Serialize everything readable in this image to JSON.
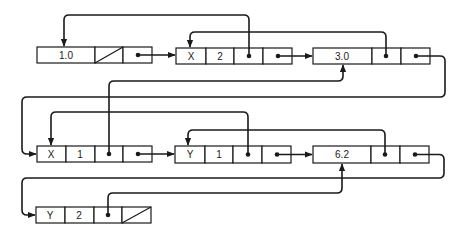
{
  "diagram": {
    "type": "linked-list-structure",
    "colors": {
      "ink": "#1a1a1a",
      "background": "#ffffff"
    },
    "nodes": [
      {
        "id": "n1",
        "fields": [
          "1.0",
          "null",
          "ptr"
        ],
        "label": "1.0"
      },
      {
        "id": "n2",
        "fields": [
          "X",
          "2",
          "ptr",
          "ptr"
        ],
        "var": "X",
        "exp": "2"
      },
      {
        "id": "n3",
        "fields": [
          "3.0",
          "ptr",
          "ptr"
        ],
        "label": "3.0"
      },
      {
        "id": "n4",
        "fields": [
          "X",
          "1",
          "ptr",
          "ptr"
        ],
        "var": "X",
        "exp": "1"
      },
      {
        "id": "n5",
        "fields": [
          "Y",
          "1",
          "ptr",
          "ptr"
        ],
        "var": "Y",
        "exp": "1"
      },
      {
        "id": "n6",
        "fields": [
          "6.2",
          "ptr",
          "ptr"
        ],
        "label": "6.2"
      },
      {
        "id": "n7",
        "fields": [
          "Y",
          "2",
          "ptr",
          "null"
        ],
        "var": "Y",
        "exp": "2"
      }
    ],
    "edges": [
      {
        "from": "n1.next",
        "to": "n2"
      },
      {
        "from": "n2.back",
        "to": "n1"
      },
      {
        "from": "n2.next",
        "to": "n3"
      },
      {
        "from": "n3.back",
        "to": "n2"
      },
      {
        "from": "n3.next",
        "to": "n4"
      },
      {
        "from": "n4.back",
        "to": "n3"
      },
      {
        "from": "n4.next",
        "to": "n5"
      },
      {
        "from": "n5.back",
        "to": "n4"
      },
      {
        "from": "n5.next",
        "to": "n6"
      },
      {
        "from": "n6.back",
        "to": "n5"
      },
      {
        "from": "n6.next",
        "to": "n7"
      },
      {
        "from": "n7.back",
        "to": "n6"
      }
    ]
  }
}
